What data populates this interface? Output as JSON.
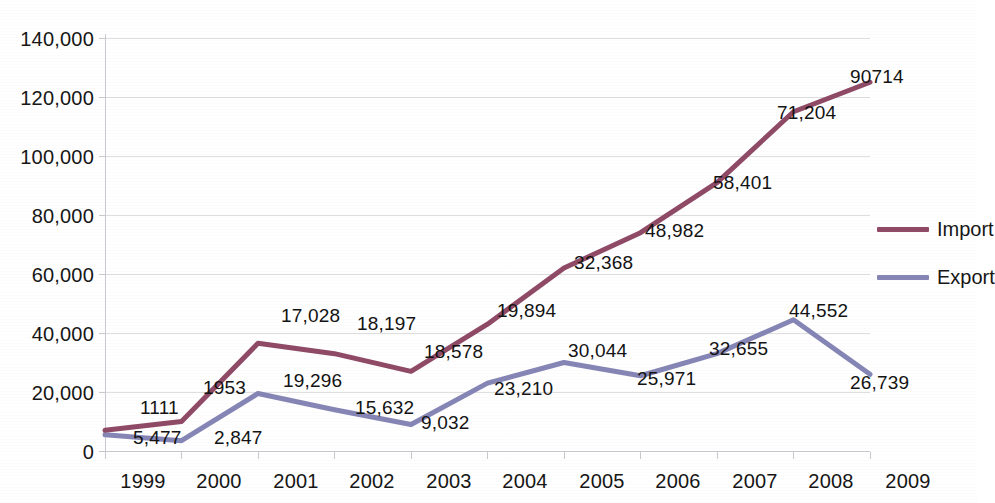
{
  "chart_data": {
    "type": "line",
    "title": "",
    "xlabel": "",
    "ylabel": "",
    "categories": [
      "1999",
      "2000",
      "2001",
      "2002",
      "2003",
      "2004",
      "2005",
      "2006",
      "2007",
      "2008",
      "2009"
    ],
    "ylim": [
      0,
      140000
    ],
    "ytick_values": [
      0,
      20000,
      40000,
      60000,
      80000,
      100000,
      120000,
      140000
    ],
    "ytick_labels": [
      "0",
      "20,000",
      "40,000",
      "60,000",
      "80,000",
      "100,000",
      "120,000",
      "140,000"
    ],
    "grid": true,
    "legend_position": "right",
    "series": [
      {
        "name": "Import",
        "color": "#8f4a66",
        "values": [
          7000,
          10000,
          36500,
          33000,
          27000,
          43000,
          62000,
          74000,
          91000,
          115000,
          125000
        ],
        "point_labels": [
          "1111",
          "1953",
          "17,028",
          "18,197",
          "18,578",
          "19,894",
          "32,368",
          "48,982",
          "58,401",
          "71,204",
          "90714"
        ]
      },
      {
        "name": "Export",
        "color": "#8686b6",
        "values": [
          5500,
          3500,
          19500,
          14000,
          9000,
          23000,
          30000,
          25500,
          33000,
          44500,
          26000
        ],
        "point_labels": [
          "5,477",
          "2,847",
          "19,296",
          "15,632",
          "9,032",
          "23,210",
          "30,044",
          "25,971",
          "32,655",
          "44,552",
          "26,739"
        ]
      }
    ]
  },
  "axis": {
    "y_ticks": [
      {
        "label": "140,000"
      },
      {
        "label": "120,000"
      },
      {
        "label": "100,000"
      },
      {
        "label": "80,000"
      },
      {
        "label": "60,000"
      },
      {
        "label": "40,000"
      },
      {
        "label": "20,000"
      },
      {
        "label": "0"
      }
    ],
    "x_ticks": [
      {
        "label": "1999"
      },
      {
        "label": "2000"
      },
      {
        "label": "2001"
      },
      {
        "label": "2002"
      },
      {
        "label": "2003"
      },
      {
        "label": "2004"
      },
      {
        "label": "2005"
      },
      {
        "label": "2006"
      },
      {
        "label": "2007"
      },
      {
        "label": "2008"
      },
      {
        "label": "2009"
      }
    ]
  },
  "legend": {
    "items": [
      {
        "label": "Import",
        "color": "#8f4a66"
      },
      {
        "label": "Export",
        "color": "#8686b6"
      }
    ]
  },
  "data_labels": {
    "import": [
      "1111",
      "1953",
      "17,028",
      "18,197",
      "18,578",
      "19,894",
      "32,368",
      "48,982",
      "58,401",
      "71,204",
      "90714"
    ],
    "export": [
      "5,477",
      "2,847",
      "19,296",
      "15,632",
      "9,032",
      "23,210",
      "30,044",
      "25,971",
      "32,655",
      "44,552",
      "26,739"
    ]
  }
}
